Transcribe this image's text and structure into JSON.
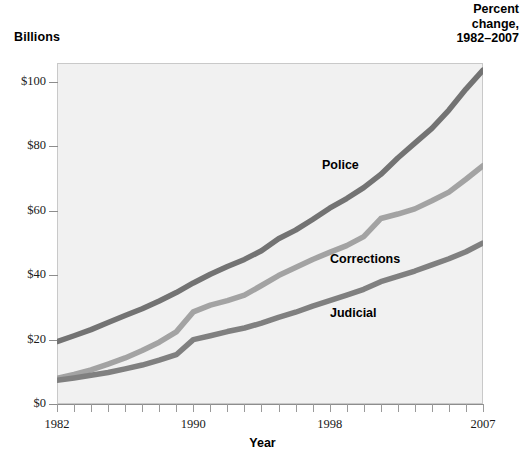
{
  "header": {
    "y_unit_label": "Billions",
    "corner_note_line1": "Percent",
    "corner_note_line2": "change,",
    "corner_note_line3": "1982–2007"
  },
  "axes": {
    "x_title": "Year",
    "x_tick_labels": [
      "1982",
      "1990",
      "1998",
      "2007"
    ],
    "y_tick_labels": [
      "$0",
      "$20",
      "$40",
      "$60",
      "$80",
      "$100"
    ]
  },
  "series_labels": {
    "police": "Police",
    "corrections": "Corrections",
    "judicial": "Judicial"
  },
  "colors": {
    "plot_background": "#f1f1f1",
    "plot_border": "#c9c9c9",
    "police_line": "#737373",
    "corrections_line": "#a3a3a3",
    "judicial_line": "#808080",
    "axis": "#8d8d8d",
    "text": "#000000"
  },
  "chart_data": {
    "type": "line",
    "title": "",
    "subtitle": "",
    "xlabel": "Year",
    "ylabel": "Billions",
    "xlim": [
      1982,
      2007
    ],
    "ylim": [
      0,
      110
    ],
    "grid": false,
    "legend": "inline-labels",
    "y_ticks": [
      0,
      20,
      40,
      60,
      80,
      100
    ],
    "y_tick_labels": [
      "$0",
      "$20",
      "$40",
      "$60",
      "$80",
      "$100"
    ],
    "x_ticks": [
      1982,
      1990,
      1998,
      2007
    ],
    "x_tick_labels": [
      "1982",
      "1990",
      "1998",
      "2007"
    ],
    "x_minor_tick_interval": 1,
    "x": [
      1982,
      1983,
      1984,
      1985,
      1986,
      1987,
      1988,
      1989,
      1990,
      1991,
      1992,
      1993,
      1994,
      1995,
      1996,
      1997,
      1998,
      1999,
      2000,
      2001,
      2002,
      2003,
      2004,
      2005,
      2006,
      2007
    ],
    "series": [
      {
        "name": "Police",
        "color": "#737373",
        "values": [
          19.4,
          21.2,
          23.1,
          25.3,
          27.5,
          29.6,
          32.0,
          34.6,
          37.6,
          40.3,
          42.7,
          44.9,
          47.6,
          51.3,
          54.0,
          57.3,
          60.8,
          63.8,
          67.2,
          71.3,
          76.4,
          81.0,
          85.6,
          91.3,
          97.8,
          103.7
        ]
      },
      {
        "name": "Corrections",
        "color": "#a3a3a3",
        "values": [
          8.0,
          9.2,
          10.6,
          12.4,
          14.3,
          16.6,
          19.2,
          22.4,
          28.6,
          30.7,
          32.1,
          33.8,
          36.8,
          39.9,
          42.4,
          44.9,
          47.1,
          49.2,
          52.0,
          57.6,
          59.0,
          60.6,
          63.1,
          65.8,
          69.8,
          74.0
        ]
      },
      {
        "name": "Judicial",
        "color": "#808080",
        "values": [
          7.4,
          8.1,
          8.9,
          9.8,
          10.9,
          12.1,
          13.6,
          15.3,
          20.0,
          21.2,
          22.5,
          23.6,
          25.1,
          26.9,
          28.5,
          30.4,
          32.1,
          33.8,
          35.6,
          38.0,
          39.6,
          41.3,
          43.2,
          45.1,
          47.3,
          50.0
        ]
      }
    ]
  }
}
